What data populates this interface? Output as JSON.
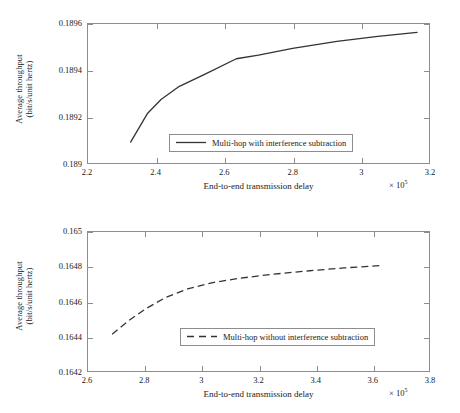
{
  "figure": {
    "panels": [
      {
        "id": "top",
        "ylabel_line1": "Average throughput",
        "ylabel_line2": "(bit/s/unit hertz)",
        "xlabel": "End-to-end transmission delay",
        "exponent_prefix": "× 10",
        "exponent_power": "5",
        "legend_label": "Multi-hop with interference subtraction",
        "legend_style": "solid",
        "yticks": [
          "0.189",
          "0.1892",
          "0.1894",
          "0.1896"
        ],
        "xticks": [
          "2.2",
          "2.4",
          "2.6",
          "2.8",
          "3",
          "3.2"
        ]
      },
      {
        "id": "bottom",
        "ylabel_line1": "Average throughput",
        "ylabel_line2": "(bit/s/unit hertz)",
        "xlabel": "End-to-end transmission delay",
        "exponent_prefix": "× 10",
        "exponent_power": "5",
        "legend_label": "Multi-hop without interference subtraction",
        "legend_style": "dashed",
        "yticks": [
          "0.1642",
          "0.1644",
          "0.1646",
          "0.1648",
          "0.165"
        ],
        "xticks": [
          "2.6",
          "2.8",
          "3",
          "3.2",
          "3.4",
          "3.6",
          "3.8"
        ]
      }
    ]
  },
  "chart_data": [
    {
      "type": "line",
      "title": "",
      "xlabel": "End-to-end transmission delay",
      "ylabel": "Average throughput (bit/s/unit hertz)",
      "x_exponent": 100000.0,
      "xlim": [
        2.2,
        3.2
      ],
      "ylim": [
        0.189,
        0.1896
      ],
      "xticks": [
        2.2,
        2.4,
        2.6,
        2.8,
        3.0,
        3.2
      ],
      "yticks": [
        0.189,
        0.1892,
        0.1894,
        0.1896
      ],
      "grid": false,
      "legend_position": "lower-right",
      "series": [
        {
          "name": "Multi-hop with interference subtraction",
          "style": "solid",
          "color": "#333333",
          "x": [
            2.325,
            2.375,
            2.415,
            2.468,
            2.545,
            2.635,
            2.7,
            2.8,
            2.93,
            3.05,
            3.165
          ],
          "y": [
            0.18909,
            0.189215,
            0.189275,
            0.189331,
            0.189385,
            0.18945,
            0.189466,
            0.189495,
            0.189525,
            0.189547,
            0.189564
          ]
        }
      ]
    },
    {
      "type": "line",
      "title": "",
      "xlabel": "End-to-end transmission delay",
      "ylabel": "Average throughput (bit/s/unit hertz)",
      "x_exponent": 100000.0,
      "xlim": [
        2.6,
        3.8
      ],
      "ylim": [
        0.1642,
        0.165
      ],
      "xticks": [
        2.6,
        2.8,
        3.0,
        3.2,
        3.4,
        3.6,
        3.8
      ],
      "yticks": [
        0.1642,
        0.1644,
        0.1646,
        0.1648,
        0.165
      ],
      "grid": false,
      "legend_position": "lower-right",
      "series": [
        {
          "name": "Multi-hop without interference subtraction",
          "style": "dashed",
          "color": "#333333",
          "x": [
            2.685,
            2.745,
            2.805,
            2.875,
            2.95,
            3.04,
            3.13,
            3.25,
            3.38,
            3.5,
            3.635
          ],
          "y": [
            0.164412,
            0.164492,
            0.16456,
            0.164625,
            0.164672,
            0.164709,
            0.164733,
            0.164757,
            0.164777,
            0.164793,
            0.164808
          ]
        }
      ]
    }
  ]
}
